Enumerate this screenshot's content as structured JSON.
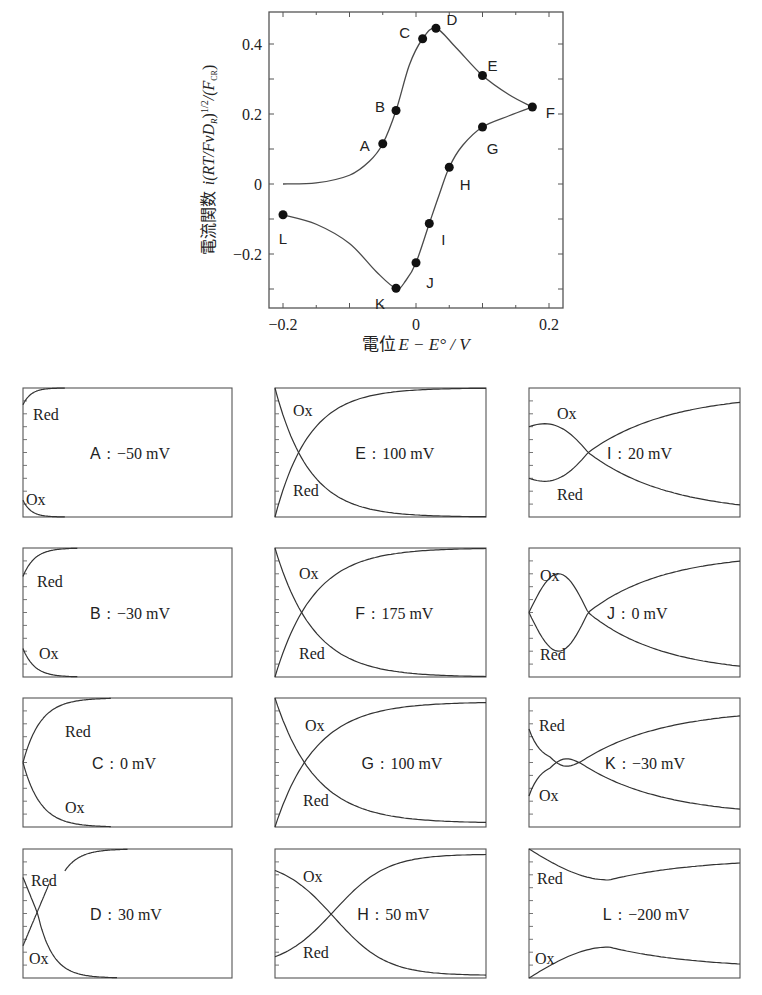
{
  "chart_data": [
    {
      "type": "line",
      "title": "",
      "xlabel": "電位 E − E° / V",
      "ylabel": "電流関数 i(RT/FvD_R)^1/2/(F C_R)",
      "xlim": [
        -0.22,
        0.22
      ],
      "ylim": [
        -0.34,
        0.48
      ],
      "xticks": [
        -0.2,
        0,
        0.2
      ],
      "xtick_labels": [
        "−0.2",
        "0",
        "0.2"
      ],
      "yticks": [
        -0.2,
        0,
        0.2,
        0.4
      ],
      "ytick_labels": [
        "−0.2",
        "0",
        "0.2",
        "0.4"
      ],
      "grid": false,
      "legend": null,
      "series": [
        {
          "name": "forward scan (oxidation)",
          "x": [
            -0.2,
            -0.15,
            -0.1,
            -0.07,
            -0.05,
            -0.03,
            -0.01,
            0.01,
            0.03,
            0.06,
            0.1,
            0.14,
            0.175
          ],
          "y": [
            0.0,
            0.003,
            0.025,
            0.065,
            0.115,
            0.21,
            0.34,
            0.415,
            0.445,
            0.39,
            0.31,
            0.255,
            0.22
          ]
        },
        {
          "name": "reverse scan (reduction)",
          "x": [
            0.175,
            0.14,
            0.1,
            0.07,
            0.05,
            0.035,
            0.02,
            0.0,
            -0.015,
            -0.03,
            -0.06,
            -0.1,
            -0.15,
            -0.2
          ],
          "y": [
            0.22,
            0.195,
            0.163,
            0.11,
            0.048,
            -0.03,
            -0.113,
            -0.225,
            -0.275,
            -0.298,
            -0.25,
            -0.17,
            -0.115,
            -0.088
          ]
        }
      ],
      "points": [
        {
          "label": "A",
          "E": -0.05,
          "i": 0.115
        },
        {
          "label": "B",
          "E": -0.03,
          "i": 0.21
        },
        {
          "label": "C",
          "E": 0.01,
          "i": 0.415
        },
        {
          "label": "D",
          "E": 0.03,
          "i": 0.445
        },
        {
          "label": "E",
          "E": 0.1,
          "i": 0.31
        },
        {
          "label": "F",
          "E": 0.175,
          "i": 0.22
        },
        {
          "label": "G",
          "E": 0.1,
          "i": 0.163
        },
        {
          "label": "H",
          "E": 0.05,
          "i": 0.048
        },
        {
          "label": "I",
          "E": 0.02,
          "i": -0.113
        },
        {
          "label": "J",
          "E": 0.0,
          "i": -0.225
        },
        {
          "label": "K",
          "E": -0.03,
          "i": -0.298
        },
        {
          "label": "L",
          "E": -0.2,
          "i": -0.088
        }
      ]
    },
    {
      "type": "line",
      "title": "Concentration profiles (Ox / Red) at points A–L",
      "panels": [
        {
          "id": "A",
          "potential": "−50 mV",
          "top_label": "Red",
          "bottom_label": "Ox"
        },
        {
          "id": "B",
          "potential": "−30 mV",
          "top_label": "Red",
          "bottom_label": "Ox"
        },
        {
          "id": "C",
          "potential": "0 mV",
          "top_label": "Red",
          "bottom_label": "Ox"
        },
        {
          "id": "D",
          "potential": "30 mV",
          "top_label": "Red",
          "bottom_label": "Ox"
        },
        {
          "id": "E",
          "potential": "100 mV",
          "top_label": "Ox",
          "bottom_label": "Red"
        },
        {
          "id": "F",
          "potential": "175 mV",
          "top_label": "Ox",
          "bottom_label": "Red"
        },
        {
          "id": "G",
          "potential": "100 mV",
          "top_label": "Ox",
          "bottom_label": "Red"
        },
        {
          "id": "H",
          "potential": "50 mV",
          "top_label": "Ox",
          "bottom_label": "Red"
        },
        {
          "id": "I",
          "potential": "20 mV",
          "top_label": "Ox",
          "bottom_label": "Red"
        },
        {
          "id": "J",
          "potential": "0 mV",
          "top_label": "Ox",
          "bottom_label": "Red"
        },
        {
          "id": "K",
          "potential": "−30 mV",
          "top_label": "Red",
          "bottom_label": "Ox"
        },
        {
          "id": "L",
          "potential": "−200 mV",
          "top_label": "Red",
          "bottom_label": "Ox"
        }
      ]
    }
  ],
  "main_plot": {
    "xlabel_prefix": "電位",
    "xlabel_math": "E − E° / V",
    "ylabel_prefix": "電流関数",
    "ylabel_math": "i(RT/FvD",
    "ylabel_sub_R": "R",
    "ylabel_mid": ")",
    "ylabel_sup": "1/2",
    "ylabel_tail": "/(F",
    "ylabel_sub_C": "CR",
    "ylabel_end": ")",
    "xtick_labels": [
      "−0.2",
      "0",
      "0.2"
    ],
    "ytick_labels": [
      "0.4",
      "0.2",
      "0",
      "−0.2"
    ]
  },
  "colors": {
    "line": "#4a4a4a",
    "marker": "#111111",
    "frame": "#555555",
    "text": "#222222"
  },
  "separator": ":"
}
